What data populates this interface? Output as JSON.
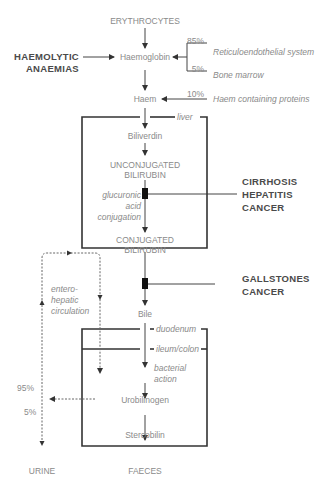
{
  "diagram": {
    "nodes": {
      "erythrocytes": "ERYTHROCYTES",
      "haemoglobin": "Haemoglobin",
      "haem": "Haem",
      "biliverdin": "Biliverdin",
      "unconjugated_1": "UNCONJUGATED",
      "unconjugated_2": "BILIRUBIN",
      "conjugated_1": "CONJUGATED",
      "conjugated_2": "BILIRUBIN",
      "bile": "Bile",
      "urobilinogen": "Urobilinogen",
      "stercobilin": "Stercobilin",
      "urine": "URINE",
      "faeces": "FAECES"
    },
    "sources": {
      "reticulo_pct": "85%",
      "reticulo_label": "Reticuloendothelial system",
      "marrow_pct": "5%",
      "marrow_label": "Bone marrow",
      "haem_proteins_pct": "10%",
      "haem_proteins_label": "Haem containing proteins"
    },
    "regions": {
      "liver": "liver",
      "duodenum": "duodenum",
      "ileum_colon": "ileum/colon"
    },
    "processes": {
      "glucuronic_1": "glucuronic",
      "glucuronic_2": "acid",
      "glucuronic_3": "conjugation",
      "bacterial_1": "bacterial",
      "bacterial_2": "action",
      "entero_1": "entero-",
      "entero_2": "hepatic",
      "entero_3": "circulation"
    },
    "split": {
      "pct_95": "95%",
      "pct_5": "5%"
    },
    "diseases": {
      "haemolytic_1": "HAEMOLYTIC",
      "haemolytic_2": "ANAEMIAS",
      "cirrhosis": "CIRRHOSIS",
      "hepatitis": "HEPATITIS",
      "cancer_liver": "CANCER",
      "gallstones": "GALLSTONES",
      "cancer_bile": "CANCER"
    },
    "colors": {
      "text": "#8a8a8a",
      "disease_text": "#4a4a4a",
      "box_line": "#333333",
      "line": "#555555"
    }
  }
}
